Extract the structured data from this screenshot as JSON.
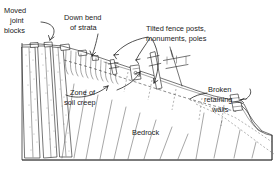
{
  "figure": {
    "type": "geological-block-diagram",
    "background_color": "#ffffff",
    "ink_color": "#1a1a1a",
    "width": 279,
    "height": 179
  },
  "labels": [
    {
      "id": "moved-joint-blocks",
      "lines": [
        "Moved",
        "joint",
        "blocks"
      ],
      "x": 4,
      "y": 7,
      "anchor": "start",
      "points_to": "displaced blocks along outcrop at crest of slope"
    },
    {
      "id": "down-bend-of-strata",
      "lines": [
        "Down bend",
        "of strata"
      ],
      "x": 64,
      "y": 14,
      "anchor": "start",
      "points_to": "curved hook of bedrock layers beneath the creeping soil"
    },
    {
      "id": "tilted-fence-posts",
      "lines": [
        "Tilted fence posts,",
        "monuments, poles"
      ],
      "x": 146,
      "y": 27,
      "anchor": "start",
      "points_to": "leaning posts, stone monuments and utility pole on slope"
    },
    {
      "id": "zone-of-soil-creep",
      "lines": [
        "Zone of",
        "soil creep"
      ],
      "x": 69,
      "y": 90,
      "anchor": "start",
      "points_to": "downslope-moving surficial mantle above bedrock"
    },
    {
      "id": "broken-retaining-walls",
      "lines": [
        "Broken",
        "retaining",
        "walls"
      ],
      "x": 208,
      "y": 87,
      "anchor": "start",
      "points_to": "fractured masonry wall low on the slope"
    },
    {
      "id": "bedrock",
      "lines": [
        "Bedrock"
      ],
      "x": 132,
      "y": 130,
      "anchor": "start",
      "points_to": "inclined strata forming the body of the hill"
    }
  ],
  "features": {
    "joint_blocks_count": 4,
    "stipple_texture": "sandstone outcrop at slope crest",
    "tilted_objects": [
      "fence post",
      "monument",
      "fence post",
      "utility pole"
    ],
    "retaining_wall": "broken, displaced downslope",
    "strata_dip": "steeply inclined to the right, bending downslope near surface",
    "frame": "rectangular block-diagram border"
  }
}
